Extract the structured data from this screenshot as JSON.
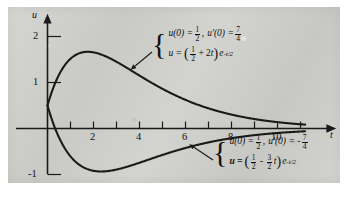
{
  "figure": {
    "background_color": "#cfcfcb",
    "curve_color": "#1a1a1a",
    "axis_color": "#1a1a1a"
  },
  "axes": {
    "x_label": "t",
    "y_label": "u",
    "x_ticks": [
      1,
      2,
      3,
      4,
      5,
      6,
      7,
      8,
      9,
      10,
      11
    ],
    "x_tick_labels": [
      {
        "value": 2,
        "text": "2"
      },
      {
        "value": 4,
        "text": "4"
      },
      {
        "value": 6,
        "text": "6"
      },
      {
        "value": 8,
        "text": "8"
      },
      {
        "value": 10,
        "text": "10"
      }
    ],
    "y_tick_labels": [
      {
        "value": 2,
        "text": "2"
      },
      {
        "value": 1,
        "text": "1"
      },
      {
        "value": -1,
        "text": "-1"
      }
    ],
    "xlim": [
      -0.35,
      12.3
    ],
    "ylim": [
      -1.45,
      2.35
    ]
  },
  "chart_data": {
    "type": "line",
    "title": "",
    "xlabel": "t",
    "ylabel": "u",
    "xlim": [
      -0.35,
      12.3
    ],
    "ylim": [
      -1.45,
      2.35
    ],
    "grid": false,
    "legend": "annotations",
    "series": [
      {
        "name": "upper",
        "equation_latex": "u = (1/2 + 2t) e^{-t/2}",
        "initial_conditions": "u(0) = 1/2, u'(0) = 7/4",
        "coefficients": {
          "a": 0.5,
          "b": 2,
          "decay": -0.5
        },
        "t_range": [
          0,
          11.2
        ],
        "key_points": [
          {
            "t": 0,
            "u": 0.5
          },
          {
            "t": 1,
            "u": 1.517
          },
          {
            "t": 1.75,
            "u": 1.667
          },
          {
            "t": 2,
            "u": 1.655
          },
          {
            "t": 4,
            "u": 1.15
          },
          {
            "t": 6,
            "u": 0.622
          },
          {
            "t": 8,
            "u": 0.302
          },
          {
            "t": 10,
            "u": 0.138
          },
          {
            "t": 11.2,
            "u": 0.085
          }
        ]
      },
      {
        "name": "lower",
        "equation_latex": "u = (1/2 - (3/2)t) e^{-t/2}",
        "initial_conditions": "u(0) = 1/2, u'(0) = -7/4",
        "coefficients": {
          "a": 0.5,
          "b": -1.5,
          "decay": -0.5
        },
        "t_range": [
          0,
          11.2
        ],
        "key_points": [
          {
            "t": 0,
            "u": 0.5
          },
          {
            "t": 0.3333,
            "u": 0.0
          },
          {
            "t": 1,
            "u": -0.607
          },
          {
            "t": 2,
            "u": -0.919
          },
          {
            "t": 2.3333,
            "u": -0.933
          },
          {
            "t": 4,
            "u": -0.744
          },
          {
            "t": 6,
            "u": -0.423
          },
          {
            "t": 8,
            "u": -0.21
          },
          {
            "t": 10,
            "u": -0.097
          },
          {
            "t": 11.2,
            "u": -0.061
          }
        ]
      }
    ]
  },
  "annotations": {
    "upper": {
      "name": "upper-curve-annotation",
      "line1": {
        "u_label": "u",
        "ic_value_text": "u(0) =",
        "ic_frac_num": "1",
        "ic_frac_den": "2",
        "comma": ",",
        "deriv_text": "u'(0) =",
        "deriv_frac_num": "7",
        "deriv_frac_den": "4"
      },
      "line2": {
        "lhs": "u =",
        "open_paren": "(",
        "frac_num": "1",
        "frac_den": "2",
        "plus": "+ 2",
        "var": "t",
        "close_paren": ")",
        "exp_base": "e",
        "exp_sup": "-t/2"
      }
    },
    "lower": {
      "name": "lower-curve-annotation",
      "line1": {
        "ic_value_text": "u(0) =",
        "ic_frac_num": "1",
        "ic_frac_den": "2",
        "comma": ",",
        "deriv_text": "u'(0) = -",
        "deriv_frac_num": "7",
        "deriv_frac_den": "4"
      },
      "line2": {
        "lhs": "u =",
        "open_paren": "(",
        "frac_num": "1",
        "frac_den": "2",
        "minus": "-",
        "frac2_num": "3",
        "frac2_den": "2",
        "var": "t",
        "close_paren": ")",
        "exp_base": "e",
        "exp_sup": "-t/2"
      }
    },
    "brace_glyph": "{"
  }
}
